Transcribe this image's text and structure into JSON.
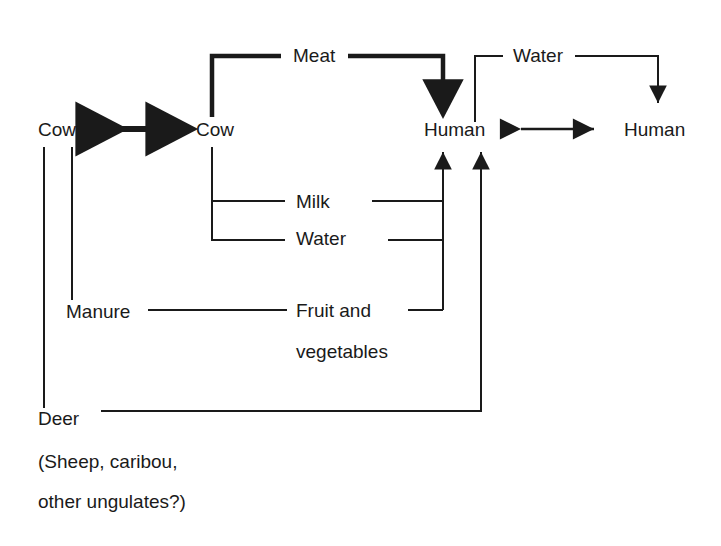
{
  "diagram": {
    "type": "flow-diagram",
    "colors": {
      "stroke": "#1a1a1a",
      "background": "#ffffff",
      "text": "#1a1a1a"
    },
    "nodes": [
      {
        "id": "cow-left",
        "label": "Cow",
        "x": 38,
        "y": 136
      },
      {
        "id": "cow-right",
        "label": "Cow",
        "x": 196,
        "y": 136
      },
      {
        "id": "human-left",
        "label": "Human",
        "x": 424,
        "y": 136
      },
      {
        "id": "human-right",
        "label": "Human",
        "x": 624,
        "y": 136
      },
      {
        "id": "manure",
        "label": "Manure",
        "x": 66,
        "y": 318
      },
      {
        "id": "deer",
        "label": "Deer",
        "x": 38,
        "y": 425
      }
    ],
    "edge_labels": [
      {
        "id": "meat",
        "label": "Meat",
        "x": 294,
        "y": 62
      },
      {
        "id": "water-top",
        "label": "Water",
        "x": 516,
        "y": 62
      },
      {
        "id": "milk",
        "label": "Milk",
        "x": 294,
        "y": 208
      },
      {
        "id": "water-mid",
        "label": "Water",
        "x": 294,
        "y": 245
      },
      {
        "id": "fruit-1",
        "label": "Fruit and",
        "x": 294,
        "y": 318
      },
      {
        "id": "fruit-2",
        "label": "vegetables",
        "x": 294,
        "y": 359
      }
    ],
    "footnotes": [
      {
        "id": "deer-note-1",
        "label": "(Sheep, caribou,",
        "x": 38,
        "y": 468
      },
      {
        "id": "deer-note-2",
        "label": "other ungulates?)",
        "x": 38,
        "y": 508
      }
    ],
    "edges": [
      {
        "id": "cow-cow-bidirectional",
        "from": "cow-left",
        "to": "cow-right",
        "style": "thick",
        "arrows": "both",
        "via": "Direct contact"
      },
      {
        "id": "cow-meat-human",
        "from": "cow-right",
        "to": "human-left",
        "style": "thick",
        "arrows": "end",
        "via": "Meat"
      },
      {
        "id": "cow-milk-human",
        "from": "cow-right",
        "to": "human-left",
        "style": "thin",
        "arrows": "end",
        "via": "Milk"
      },
      {
        "id": "cow-water-human",
        "from": "cow-right",
        "to": "human-left",
        "style": "thin",
        "arrows": "end",
        "via": "Water"
      },
      {
        "id": "manure-fruit-human",
        "from": "manure",
        "to": "human-left",
        "style": "thin",
        "arrows": "end",
        "via": "Fruit and vegetables"
      },
      {
        "id": "cow-manure",
        "from": "cow-left",
        "to": "manure",
        "style": "thin",
        "arrows": "none",
        "via": ""
      },
      {
        "id": "cow-deer",
        "from": "cow-left",
        "to": "deer",
        "style": "thin",
        "arrows": "none",
        "via": ""
      },
      {
        "id": "deer-human",
        "from": "deer",
        "to": "human-left",
        "style": "thin",
        "arrows": "end",
        "via": ""
      },
      {
        "id": "human-human",
        "from": "human-left",
        "to": "human-right",
        "style": "thin",
        "arrows": "both",
        "via": "Direct contact"
      },
      {
        "id": "human-water-human",
        "from": "human-left",
        "to": "human-right",
        "style": "thin",
        "arrows": "end",
        "via": "Water"
      }
    ]
  }
}
